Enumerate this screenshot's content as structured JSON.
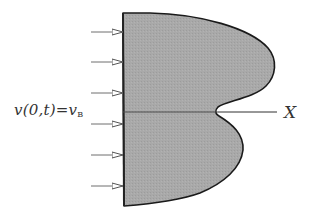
{
  "diagram": {
    "type": "cross-section of deformed body under uniform inflow",
    "boundary_condition": {
      "lhs": "v(0,t)=v",
      "subscript": "B",
      "full_text": "v(0,t)=v_B"
    },
    "axis": {
      "label": "X"
    },
    "arrows": {
      "count": 6,
      "direction": "right",
      "y_positions": [
        32,
        62,
        93,
        124,
        155,
        186
      ]
    },
    "shape": {
      "fill_color": "#a8a8a8",
      "stroke_color": "#1a1a1a",
      "description": "Body clamped on the left edge, with two bulging lobes to the right separated by a cusp on the X axis; the upper lobe extends farther than the lower one"
    },
    "colors": {
      "background": "#ffffff",
      "arrow": "#6f6f6f",
      "axis_line": "#777777",
      "text": "#333333"
    }
  }
}
